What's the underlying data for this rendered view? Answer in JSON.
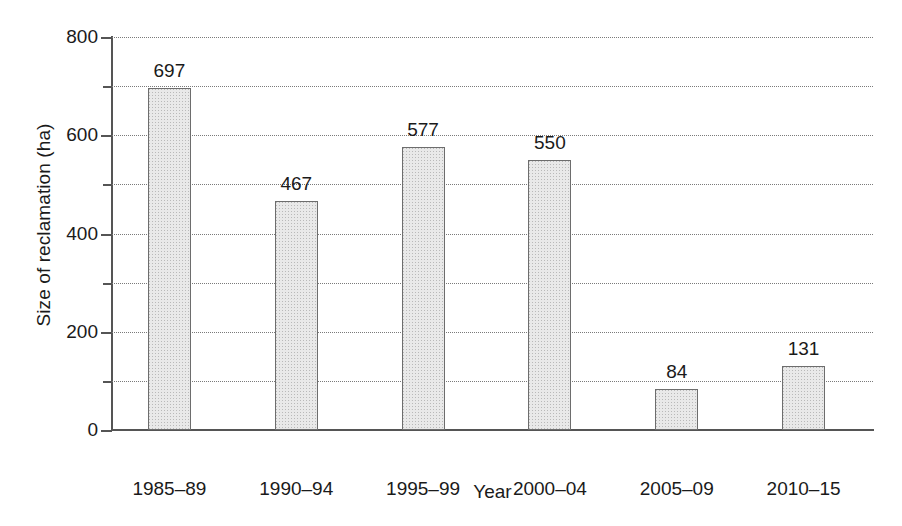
{
  "chart_data": {
    "type": "bar",
    "title": "",
    "subtitle": "",
    "xlabel": "Year",
    "ylabel": "Size of reclamation (ha)",
    "categories": [
      "1985–89",
      "1990–94",
      "1995–99",
      "2000–04",
      "2005–09",
      "2010–15"
    ],
    "values": [
      697,
      467,
      577,
      550,
      84,
      131
    ],
    "value_labels": [
      "697",
      "467",
      "577",
      "550",
      "84",
      "131"
    ],
    "ylim": [
      0,
      800
    ],
    "ytick_major": [
      0,
      200,
      400,
      600,
      800
    ],
    "ytick_major_labels": [
      "0",
      "200",
      "400",
      "600",
      "800"
    ],
    "ytick_minor": [
      100,
      300,
      500,
      700
    ],
    "gridlines": [
      100,
      200,
      300,
      400,
      500,
      600,
      700,
      800
    ],
    "grid": "horizontal-dotted",
    "legend": "none",
    "annotations": [],
    "colors": {
      "bar_fill": "#e9e9e9",
      "bar_edge": "#6d6d6d",
      "grid": "#7a7a7a",
      "axis": "#555555",
      "text": "#1a1a1a",
      "background": "#ffffff"
    }
  }
}
